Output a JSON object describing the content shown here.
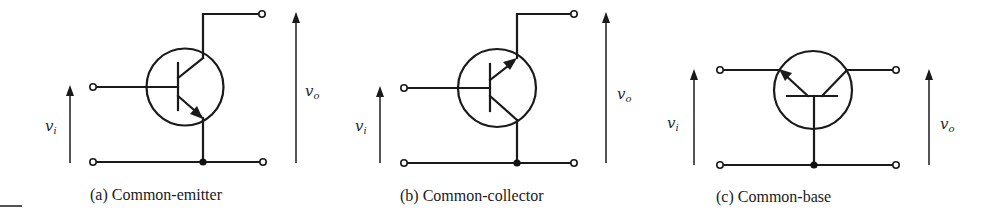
{
  "figure": {
    "stroke_color": "#1a1a1a",
    "background": "#ffffff",
    "panels": [
      {
        "id": "a",
        "caption": "(a) Common-emitter",
        "input_label": "v",
        "input_sub": "i",
        "output_label": "v",
        "output_sub": "o",
        "configuration": "common-emitter",
        "transistor": "NPN"
      },
      {
        "id": "b",
        "caption": "(b) Common-collector",
        "input_label": "v",
        "input_sub": "i",
        "output_label": "v",
        "output_sub": "o",
        "configuration": "common-collector",
        "transistor": "PNP"
      },
      {
        "id": "c",
        "caption": "(c) Common-base",
        "input_label": "v",
        "input_sub": "i",
        "output_label": "v",
        "output_sub": "o",
        "configuration": "common-base",
        "transistor": "PNP"
      }
    ]
  }
}
